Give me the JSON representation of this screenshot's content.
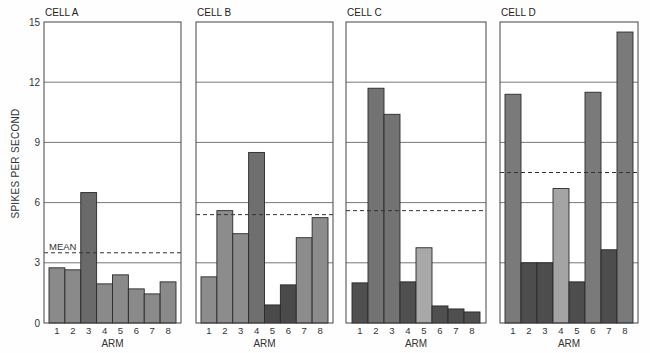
{
  "chart_data": {
    "type": "bar",
    "ylabel": "SPIKES PER SECOND",
    "xlabel": "ARM",
    "ylim": [
      0,
      15
    ],
    "yticks": [
      0,
      3,
      6,
      9,
      12,
      15
    ],
    "grid": true,
    "mean_label": "MEAN",
    "categories": [
      "1",
      "2",
      "3",
      "4",
      "5",
      "6",
      "7",
      "8"
    ],
    "panels": [
      {
        "title": "CELL A",
        "values": [
          2.75,
          2.65,
          6.5,
          1.95,
          2.4,
          1.7,
          1.45,
          2.05
        ],
        "shades": [
          "#8a8a8a",
          "#8a8a8a",
          "#6a6a6a",
          "#8a8a8a",
          "#8a8a8a",
          "#8a8a8a",
          "#8a8a8a",
          "#8a8a8a"
        ],
        "mean": 3.5
      },
      {
        "title": "CELL B",
        "values": [
          2.3,
          5.6,
          4.45,
          8.5,
          0.9,
          1.9,
          4.25,
          5.25
        ],
        "shades": [
          "#8c8c8c",
          "#8c8c8c",
          "#8c8c8c",
          "#6f6f6f",
          "#4a4a4a",
          "#4a4a4a",
          "#8c8c8c",
          "#8c8c8c"
        ],
        "mean": 5.4
      },
      {
        "title": "CELL C",
        "values": [
          2.0,
          11.7,
          10.4,
          2.05,
          3.75,
          0.85,
          0.7,
          0.55
        ],
        "shades": [
          "#4f4f4f",
          "#737373",
          "#737373",
          "#4f4f4f",
          "#a8a8a8",
          "#4f4f4f",
          "#4f4f4f",
          "#4f4f4f"
        ],
        "mean": 5.6
      },
      {
        "title": "CELL D",
        "values": [
          11.4,
          3.0,
          3.0,
          6.7,
          2.05,
          11.5,
          3.65,
          14.5
        ],
        "shades": [
          "#7a7a7a",
          "#4d4d4d",
          "#4d4d4d",
          "#a4a4a4",
          "#4d4d4d",
          "#7a7a7a",
          "#4d4d4d",
          "#7a7a7a"
        ],
        "mean": 7.5
      }
    ]
  }
}
